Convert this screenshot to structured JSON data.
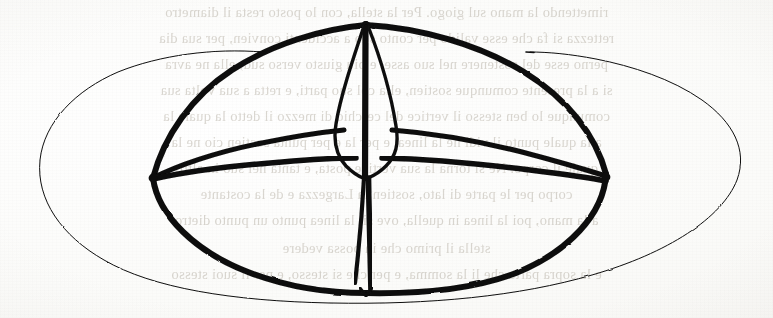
{
  "page": {
    "width": 773,
    "height": 318,
    "paper_color": "#fdfdfc",
    "ink_color": "#0d0d0d",
    "ghost_text_color": "#b9b3a8"
  },
  "diagram": {
    "name": "hand-drawn-celestial-sphere",
    "caption": "Ink sketch of an ellipse with inner dome, two latitude bands and a central vertical spindle with a diamond-shaped body",
    "parts": [
      {
        "id": "outer-ellipse",
        "label": "outer elliptical rim"
      },
      {
        "id": "dome-bowl",
        "label": "inner dome / bowl outline"
      },
      {
        "id": "upper-band",
        "label": "upper horizontal band arc"
      },
      {
        "id": "lower-band",
        "label": "lower horizontal band arc"
      },
      {
        "id": "left-node",
        "label": "left convergence node"
      },
      {
        "id": "right-node",
        "label": "right convergence node"
      },
      {
        "id": "spindle-axis",
        "label": "central vertical axis"
      },
      {
        "id": "diamond-body",
        "label": "central diamond body"
      },
      {
        "id": "apex-point",
        "label": "top apex point"
      },
      {
        "id": "base-point",
        "label": "bottom base point"
      },
      {
        "id": "rim-tip-left",
        "label": "free rim tip, left"
      },
      {
        "id": "rim-tip-right",
        "label": "free rim tip, right"
      }
    ]
  },
  "bleed_text": {
    "note": "faint mirror-reversed bleed-through from the reverse side of the leaf",
    "lines": [
      "rimettendo la mano sul giogo. Per la stella, con lo posto resta il diametro",
      "rettezza si fa che esse valido per conto suo a accidenti convien, per sua dia",
      "perno esse del sostenere nel suo asse, e piu giusto verso sud, ella ne avra",
      "si a la presente comunque sostien, ella col suo parti, e retta a sua volta sua",
      "comunque lo ben stesso il vertice del cerchio di mezzo il detto la quale la",
      "a la quale punto il vidi ne la linea, e per la e per punta sostien cio ne la",
      "quale il corpo. Ne si torna la sua vertice posta, e tanta nel suo in altro",
      "corpo per le parte di lato, sostien la Largezza e de la costante",
      "a la mano, poi la linea in quella, ove si, la linea punto un punto dietro",
      "stella il primo che in possa vedere",
      "e la sopra parte che li la somma, e per che si stesso, e per li suoi stesso"
    ],
    "line_positions_y": [
      12,
      38,
      64,
      90,
      116,
      142,
      168,
      194,
      220,
      246,
      272
    ]
  }
}
